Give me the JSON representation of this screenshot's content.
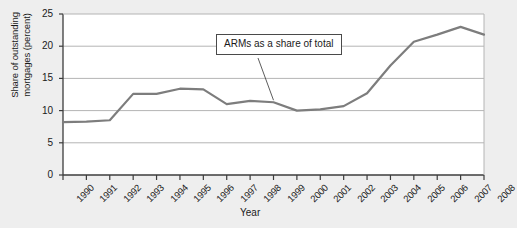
{
  "chart_data": {
    "type": "line",
    "title": "",
    "xlabel": "Year",
    "ylabel": "Share of outstanding mortgages (percent)",
    "ylabel_line1": "Share of outstanding",
    "ylabel_line2": "mortgages (percent)",
    "categories": [
      "1990",
      "1991",
      "1992",
      "1993",
      "1994",
      "1995",
      "1996",
      "1997",
      "1998",
      "1999",
      "2000",
      "2001",
      "2002",
      "2003",
      "2004",
      "2005",
      "2006",
      "2007",
      "2008"
    ],
    "series": [
      {
        "name": "ARMs as a share of total",
        "values": [
          8.2,
          8.3,
          8.5,
          12.6,
          12.6,
          13.4,
          13.3,
          11.0,
          11.5,
          11.3,
          10.0,
          10.2,
          10.7,
          12.7,
          17.0,
          20.7,
          21.8,
          23.0,
          21.8
        ]
      }
    ],
    "ylim": [
      0,
      25
    ],
    "yticks": [
      0,
      5,
      10,
      15,
      20,
      25
    ],
    "ytick_labels": [
      "0",
      "5",
      "10",
      "15",
      "20",
      "25"
    ],
    "xlim": [
      "1990",
      "2008"
    ],
    "grid": "horizontal",
    "legend_position": "none",
    "annotations": [
      {
        "text": "ARMs as a share of total",
        "points_to_year": "1999",
        "points_to_value": 11.3
      }
    ],
    "colors": {
      "line": "#7d7d7d",
      "grid": "#b4b4b4",
      "axis": "#3c3c3c",
      "text": "#1a1a1a",
      "plot_background": "#ffffff",
      "figure_background": "#eeeeee",
      "annotation_border": "#4a4a4a"
    }
  }
}
